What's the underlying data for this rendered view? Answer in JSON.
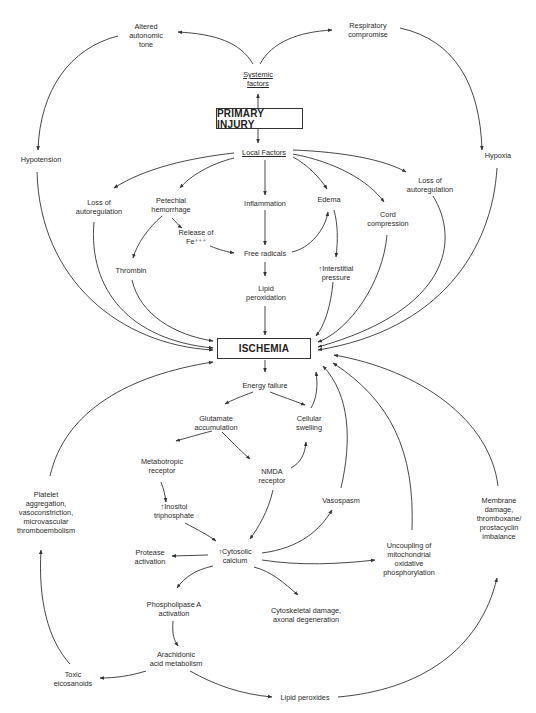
{
  "diagram": {
    "title_nodes": {
      "primary_injury": "PRIMARY INJURY",
      "ischemia": "ISCHEMIA"
    },
    "nodes": {
      "systemic_factors": [
        "Systemic",
        "factors"
      ],
      "altered_autonomic_tone": [
        "Altered",
        "autonomic",
        "tone"
      ],
      "respiratory_compromise": [
        "Respiratory",
        "compromise"
      ],
      "hypotension": [
        "Hypotension"
      ],
      "hypoxia": [
        "Hypoxia"
      ],
      "local_factors": [
        "Local Factors"
      ],
      "loss_autoreg_left": [
        "Loss of",
        "autoregulation"
      ],
      "petechial_hemorrhage": [
        "Petechial",
        "hemorrhage"
      ],
      "inflammation": [
        "Inflammation"
      ],
      "edema": [
        "Edema"
      ],
      "cord_compression": [
        "Cord",
        "compression"
      ],
      "loss_autoreg_right": [
        "Loss of",
        "autoregulation"
      ],
      "release_fe": [
        "Release of",
        "Fe⁺⁺⁺"
      ],
      "free_radicals": [
        "Free radicals"
      ],
      "thrombin": [
        "Thrombin"
      ],
      "interstitial_pressure": [
        "↑Interstitial",
        "pressure"
      ],
      "lipid_peroxidation": [
        "Lipid",
        "peroxidation"
      ],
      "energy_failure": [
        "Energy failure"
      ],
      "glutamate_accumulation": [
        "Glutamate",
        "accumulation"
      ],
      "cellular_swelling": [
        "Cellular",
        "swelling"
      ],
      "metabotropic_receptor": [
        "Metabotropic",
        "receptor"
      ],
      "nmda_receptor": [
        "NMDA",
        "receptor"
      ],
      "inositol_triphosphate": [
        "↑Inositol",
        "triphosphate"
      ],
      "platelet_aggregation": [
        "Platelet",
        "aggregation,",
        "vasoconstriction,",
        "microvascular",
        "thromboembolism"
      ],
      "vasospasm": [
        "Vasospasm"
      ],
      "membrane_damage": [
        "Membrane",
        "damage,",
        "thromboxane/",
        "prostacyclin",
        "imbalance"
      ],
      "cytosolic_calcium": [
        "↑Cytosolic",
        "calcium"
      ],
      "protease_activation": [
        "Protease",
        "activation"
      ],
      "uncoupling": [
        "Uncoupling of",
        "mitochondrial",
        "oxidative",
        "phosphorylation"
      ],
      "phospholipase_a": [
        "Phospholipase A",
        "activation"
      ],
      "cytoskeletal_damage": [
        "Cytoskeletal damage,",
        "axonal degeneration"
      ],
      "arachidonic_acid": [
        "Arachidonic",
        "acid metabolism"
      ],
      "toxic_eicosanoids": [
        "Toxic",
        "eicosanoids"
      ],
      "lipid_peroxides": [
        "Lipid peroxides"
      ]
    },
    "colors": {
      "line": "#333333",
      "text": "#2a2a2a",
      "background": "#ffffff"
    }
  }
}
